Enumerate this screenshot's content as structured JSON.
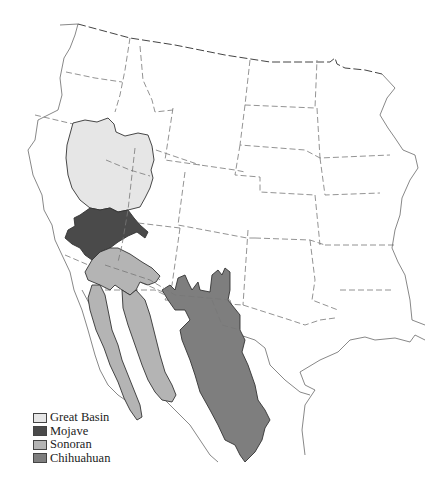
{
  "map": {
    "title": "North American Deserts",
    "regions": [
      {
        "id": "great-basin",
        "name": "Great Basin",
        "color": "#e6e6e6"
      },
      {
        "id": "mojave",
        "name": "Mojave",
        "color": "#4a4a4a"
      },
      {
        "id": "sonoran",
        "name": "Sonoran",
        "color": "#b4b4b4"
      },
      {
        "id": "chihuahuan",
        "name": "Chihuahuan",
        "color": "#7e7e7e"
      }
    ]
  },
  "legend": {
    "items": [
      {
        "label": "Great Basin",
        "color": "#e6e6e6"
      },
      {
        "label": "Mojave",
        "color": "#4a4a4a"
      },
      {
        "label": "Sonoran",
        "color": "#b4b4b4"
      },
      {
        "label": "Chihuahuan",
        "color": "#7e7e7e"
      }
    ]
  }
}
